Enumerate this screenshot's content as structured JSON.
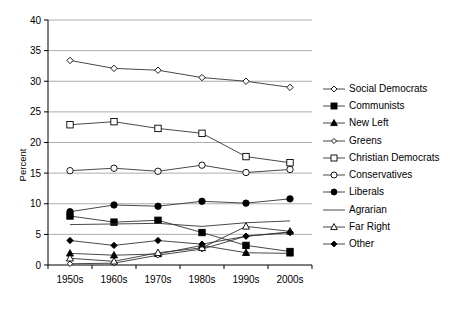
{
  "chart_data": {
    "type": "line",
    "title": "",
    "xlabel": "",
    "ylabel": "Percent",
    "categories": [
      "1950s",
      "1960s",
      "1970s",
      "1980s",
      "1990s",
      "2000s"
    ],
    "ylim": [
      0,
      40
    ],
    "ytick_labels": [
      "0",
      "5",
      "10",
      "15",
      "20",
      "25",
      "30",
      "35",
      "40"
    ],
    "ytick_values": [
      0,
      5,
      10,
      15,
      20,
      25,
      30,
      35,
      40
    ],
    "grid": "horizontal",
    "legend_position": "right",
    "series": [
      {
        "name": "Social Democrats",
        "marker": "open-diamond",
        "values": [
          33.4,
          32.1,
          31.8,
          30.6,
          30.0,
          29.0
        ]
      },
      {
        "name": "Communists",
        "marker": "filled-square",
        "values": [
          8.0,
          7.0,
          7.3,
          5.3,
          3.2,
          2.2
        ]
      },
      {
        "name": "New Left",
        "marker": "filled-triangle",
        "values": [
          1.9,
          1.6,
          1.8,
          3.2,
          2.0,
          1.9
        ]
      },
      {
        "name": "Greens",
        "marker": "open-diamond-small",
        "values": [
          0.2,
          0.3,
          1.6,
          2.6,
          4.7,
          5.4
        ]
      },
      {
        "name": "Christian Democrats",
        "marker": "open-square",
        "values": [
          22.9,
          23.4,
          22.3,
          21.5,
          17.7,
          16.7
        ]
      },
      {
        "name": "Conservatives",
        "marker": "open-circle",
        "values": [
          15.4,
          15.8,
          15.3,
          16.3,
          15.1,
          15.6
        ]
      },
      {
        "name": "Liberals",
        "marker": "filled-circle",
        "values": [
          8.7,
          9.8,
          9.6,
          10.4,
          10.1,
          10.8
        ]
      },
      {
        "name": "Agrarian",
        "marker": "none",
        "values": [
          6.6,
          6.7,
          6.8,
          6.3,
          6.9,
          7.2
        ]
      },
      {
        "name": "Far Right",
        "marker": "open-triangle",
        "values": [
          1.1,
          0.6,
          2.0,
          2.8,
          6.3,
          5.5
        ]
      },
      {
        "name": "Other",
        "marker": "filled-diamond",
        "values": [
          4.0,
          3.2,
          4.0,
          3.4,
          4.7,
          5.3
        ]
      }
    ]
  }
}
